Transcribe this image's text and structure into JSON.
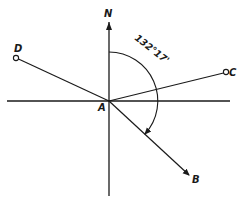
{
  "diagram": {
    "type": "bearing-diagram",
    "north_label": "N",
    "origin_label": "A",
    "points": [
      {
        "label": "D",
        "marker": "circle"
      },
      {
        "label": "C",
        "marker": "circle"
      },
      {
        "label": "B",
        "marker": "arrow"
      }
    ],
    "angle": {
      "label": "132°17'",
      "from": "N",
      "to": "B",
      "direction": "clockwise"
    },
    "colors": {
      "ink": "#1a1a1a",
      "background": "#ffffff"
    }
  }
}
